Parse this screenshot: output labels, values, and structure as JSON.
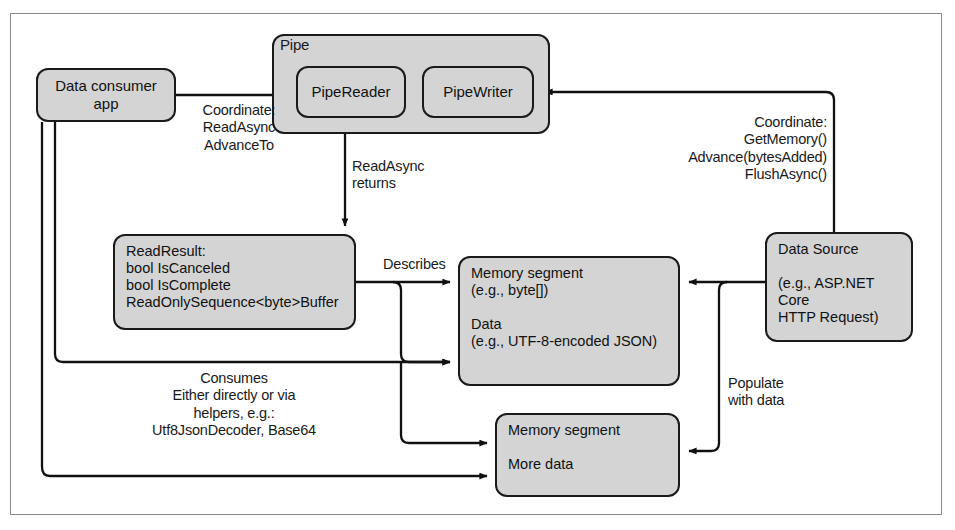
{
  "figure": {
    "colors": {
      "node_fill": "#d4d4d4",
      "node_stroke": "#1a1a1a",
      "frame_stroke": "#8a8a8a",
      "text": "#111111",
      "background": "#ffffff"
    }
  },
  "nodes": {
    "pipe_container": {
      "label": "Pipe"
    },
    "pipe_reader": {
      "label": "PipeReader"
    },
    "pipe_writer": {
      "label": "PipeWriter"
    },
    "data_consumer_app": {
      "label": "Data consumer\napp"
    },
    "read_result": {
      "label": "ReadResult:\nbool IsCanceled\nbool IsComplete\nReadOnlySequence<byte>Buffer"
    },
    "memory_segment_1": {
      "label": "Memory segment\n(e.g., byte[])\n\nData\n(e.g., UTF-8-encoded JSON)"
    },
    "memory_segment_2": {
      "label": "Memory segment\n\nMore data"
    },
    "data_source": {
      "label": "Data Source\n\n(e.g., ASP.NET Core\nHTTP Request)"
    }
  },
  "edge_labels": {
    "consumer_to_reader": "Coordinate:\nReadAsync\nAdvanceTo",
    "reader_to_readresult": "ReadAsync\nreturns",
    "source_to_writer": "Coordinate:\nGetMemory()\nAdvance(bytesAdded)\nFlushAsync()",
    "readresult_to_memory": "Describes",
    "consumer_to_memory": "Consumes\nEither directly or via\nhelpers, e.g.:\nUtf8JsonDecoder, Base64",
    "source_to_memory": "Populate\nwith data"
  }
}
